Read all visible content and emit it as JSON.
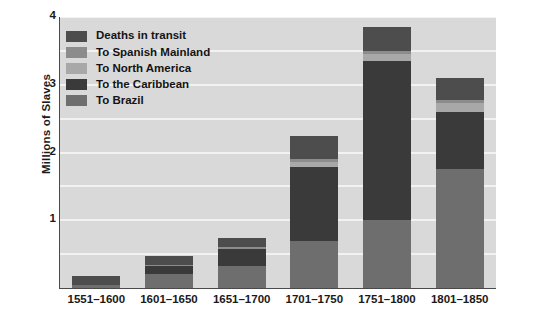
{
  "chart_data": {
    "type": "bar",
    "subtype": "stacked",
    "title": "",
    "xlabel": "",
    "ylabel": "Millions of Slaves",
    "ylim": [
      0,
      4
    ],
    "yticks": [
      1,
      2,
      3,
      4
    ],
    "ytick_labels": [
      "1",
      "2",
      "3",
      "4"
    ],
    "grid": true,
    "grid_axis": "y",
    "legend_position": "upper-left-inside",
    "categories": [
      "1551–1600",
      "1601–1650",
      "1651–1700",
      "1701–1750",
      "1751–1800",
      "1801–1850"
    ],
    "series": [
      {
        "name": "To Brazil",
        "color": "#6e6e6e",
        "values": [
          0.05,
          0.2,
          0.32,
          0.7,
          1.0,
          1.75
        ]
      },
      {
        "name": "To the Caribbean",
        "color": "#3a3a3a",
        "values": [
          0.0,
          0.12,
          0.26,
          1.08,
          2.35,
          0.85
        ]
      },
      {
        "name": "To North America",
        "color": "#a8a8a8",
        "values": [
          0.0,
          0.0,
          0.0,
          0.08,
          0.1,
          0.13
        ]
      },
      {
        "name": "To Spanish Mainland",
        "color": "#8c8c8c",
        "values": [
          0.0,
          0.02,
          0.03,
          0.04,
          0.05,
          0.04
        ]
      },
      {
        "name": "Deaths in transit",
        "color": "#4d4d4d",
        "values": [
          0.13,
          0.14,
          0.13,
          0.35,
          0.35,
          0.33
        ]
      }
    ],
    "totals": [
      0.18,
      0.48,
      0.74,
      2.25,
      3.85,
      3.1
    ],
    "annotations": []
  },
  "legend": {
    "items": [
      {
        "label": "Deaths in transit",
        "color": "#4d4d4d"
      },
      {
        "label": "To Spanish Mainland",
        "color": "#8c8c8c"
      },
      {
        "label": "To North America",
        "color": "#a8a8a8"
      },
      {
        "label": "To the Caribbean",
        "color": "#3a3a3a"
      },
      {
        "label": "To Brazil",
        "color": "#6e6e6e"
      }
    ]
  },
  "axes": {
    "y_title": "Millions of Slaves",
    "y_tick_labels": [
      "4",
      "3",
      "2",
      "1"
    ],
    "x_tick_labels": [
      "1551–1600",
      "1601–1650",
      "1651–1700",
      "1701–1750",
      "1751–1800",
      "1801–1850"
    ]
  },
  "style": {
    "plot_background": "#d9d9d9",
    "gridline_color": "#f2f2f2",
    "axis_color": "#4a4a4a",
    "page_background": "#ffffff",
    "text_color": "#1a1a1a"
  }
}
